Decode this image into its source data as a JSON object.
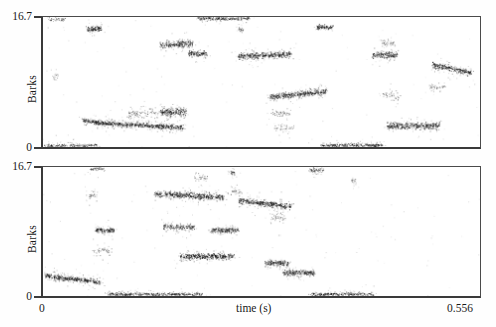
{
  "figure": {
    "title": "",
    "background_color": "#ffffff",
    "ink_color": "#1a1a1a",
    "axis_color": "#3a3a3a"
  },
  "axis_labels": {
    "y_title": "Barks",
    "y_max_top": "16.7",
    "y_min_top": "0",
    "y_max_bottom": "16.7",
    "y_min_bottom": "0",
    "x_title": "time (s)",
    "x_min": "0",
    "x_max": "0.556"
  },
  "chart_data": [
    {
      "type": "scatter",
      "panel": "top",
      "title": "",
      "xlabel": "",
      "ylabel": "Barks",
      "xlim": [
        0,
        0.556
      ],
      "ylim": [
        0,
        16.7
      ],
      "grid": false,
      "legend": "none",
      "marker_color": "#121212",
      "description": "Auditory cochleagram-style point cloud; dark elongated tracks represent formant / harmonic energy streaks.",
      "tracks": [
        {
          "name": "t-low-edge-a",
          "x0": 0.002,
          "x1": 0.068,
          "y0": 0.25,
          "y1": 0.25,
          "thickness": 0.4,
          "density": 0.45,
          "spread": 0.35
        },
        {
          "name": "t-hi-edge-a",
          "x0": 0.006,
          "x1": 0.028,
          "y0": 16.45,
          "y1": 16.45,
          "thickness": 0.4,
          "density": 0.3,
          "spread": 0.4
        },
        {
          "name": "t-blob-1",
          "x0": 0.055,
          "x1": 0.075,
          "y0": 15.2,
          "y1": 15.25,
          "thickness": 0.75,
          "density": 0.95,
          "spread": 0.35
        },
        {
          "name": "t-faint-1",
          "x0": 0.012,
          "x1": 0.018,
          "y0": 9.2,
          "y1": 9.2,
          "thickness": 0.4,
          "density": 0.18,
          "spread": 0.45
        },
        {
          "name": "t-low-1",
          "x0": 0.05,
          "x1": 0.068,
          "y0": 3.45,
          "y1": 3.3,
          "thickness": 0.55,
          "density": 0.8,
          "spread": 0.35
        },
        {
          "name": "t-low-sweep",
          "x0": 0.066,
          "x1": 0.178,
          "y0": 3.15,
          "y1": 2.55,
          "thickness": 0.6,
          "density": 0.92,
          "spread": 0.55
        },
        {
          "name": "t-cloud-1",
          "x0": 0.108,
          "x1": 0.168,
          "y0": 4.2,
          "y1": 4.5,
          "thickness": 1.1,
          "density": 0.35,
          "spread": 1.1
        },
        {
          "name": "t-blob-2",
          "x0": 0.15,
          "x1": 0.182,
          "y0": 4.55,
          "y1": 4.55,
          "thickness": 0.95,
          "density": 0.9,
          "spread": 0.6
        },
        {
          "name": "t-blob-3",
          "x0": 0.148,
          "x1": 0.19,
          "y0": 13.1,
          "y1": 13.35,
          "thickness": 0.8,
          "density": 0.88,
          "spread": 0.5
        },
        {
          "name": "t-blob-4",
          "x0": 0.185,
          "x1": 0.208,
          "y0": 12.05,
          "y1": 12.05,
          "thickness": 0.65,
          "density": 0.85,
          "spread": 0.4
        },
        {
          "name": "t-hi-edge-b",
          "x0": 0.196,
          "x1": 0.262,
          "y0": 16.55,
          "y1": 16.55,
          "thickness": 0.4,
          "density": 0.55,
          "spread": 0.3
        },
        {
          "name": "t-tick-1",
          "x0": 0.248,
          "x1": 0.254,
          "y0": 15.1,
          "y1": 15.1,
          "thickness": 0.55,
          "density": 0.45,
          "spread": 0.5
        },
        {
          "name": "t-arch-1",
          "x0": 0.248,
          "x1": 0.315,
          "y0": 11.7,
          "y1": 11.95,
          "thickness": 0.7,
          "density": 0.9,
          "spread": 0.55
        },
        {
          "name": "t-mid-rise",
          "x0": 0.288,
          "x1": 0.36,
          "y0": 6.45,
          "y1": 7.2,
          "thickness": 0.7,
          "density": 0.92,
          "spread": 0.5
        },
        {
          "name": "t-faint-2",
          "x0": 0.29,
          "x1": 0.315,
          "y0": 4.35,
          "y1": 4.35,
          "thickness": 0.7,
          "density": 0.25,
          "spread": 0.7
        },
        {
          "name": "t-faint-3",
          "x0": 0.292,
          "x1": 0.318,
          "y0": 2.55,
          "y1": 2.55,
          "thickness": 0.6,
          "density": 0.2,
          "spread": 0.7
        },
        {
          "name": "t-blob-5",
          "x0": 0.348,
          "x1": 0.368,
          "y0": 15.45,
          "y1": 15.45,
          "thickness": 0.55,
          "density": 0.85,
          "spread": 0.3
        },
        {
          "name": "t-low-edge-b",
          "x0": 0.352,
          "x1": 0.432,
          "y0": 0.28,
          "y1": 0.28,
          "thickness": 0.4,
          "density": 0.55,
          "spread": 0.35
        },
        {
          "name": "t-blob-6",
          "x0": 0.418,
          "x1": 0.45,
          "y0": 11.85,
          "y1": 11.85,
          "thickness": 0.75,
          "density": 0.88,
          "spread": 0.55
        },
        {
          "name": "t-faint-4",
          "x0": 0.428,
          "x1": 0.448,
          "y0": 13.4,
          "y1": 13.4,
          "thickness": 0.65,
          "density": 0.3,
          "spread": 0.7
        },
        {
          "name": "t-faint-5",
          "x0": 0.432,
          "x1": 0.452,
          "y0": 7.1,
          "y1": 6.3,
          "thickness": 0.7,
          "density": 0.28,
          "spread": 0.85
        },
        {
          "name": "t-low-bar",
          "x0": 0.438,
          "x1": 0.505,
          "y0": 2.75,
          "y1": 2.8,
          "thickness": 0.8,
          "density": 0.92,
          "spread": 0.5
        },
        {
          "name": "t-descend",
          "x0": 0.495,
          "x1": 0.545,
          "y0": 10.6,
          "y1": 9.55,
          "thickness": 0.7,
          "density": 0.88,
          "spread": 0.5
        },
        {
          "name": "t-faint-6",
          "x0": 0.492,
          "x1": 0.512,
          "y0": 7.7,
          "y1": 7.7,
          "thickness": 0.7,
          "density": 0.25,
          "spread": 0.75
        }
      ]
    },
    {
      "type": "scatter",
      "panel": "bottom",
      "title": "",
      "xlabel": "time (s)",
      "ylabel": "Barks",
      "xlim": [
        0,
        0.556
      ],
      "ylim": [
        0,
        16.7
      ],
      "grid": false,
      "legend": "none",
      "marker_color": "#121212",
      "description": "Resynthesised / second-condition cochleagram; tracks are flatter and more segmented.",
      "tracks": [
        {
          "name": "b-low-sweep",
          "x0": 0.002,
          "x1": 0.072,
          "y0": 2.65,
          "y1": 1.85,
          "thickness": 0.6,
          "density": 0.9,
          "spread": 0.55
        },
        {
          "name": "b-hi-edge-a",
          "x0": 0.06,
          "x1": 0.078,
          "y0": 16.5,
          "y1": 16.5,
          "thickness": 0.4,
          "density": 0.4,
          "spread": 0.35
        },
        {
          "name": "b-faint-1",
          "x0": 0.055,
          "x1": 0.068,
          "y0": 13.05,
          "y1": 13.05,
          "thickness": 0.85,
          "density": 0.3,
          "spread": 0.8
        },
        {
          "name": "b-blob-1",
          "x0": 0.066,
          "x1": 0.09,
          "y0": 8.55,
          "y1": 8.55,
          "thickness": 0.65,
          "density": 0.88,
          "spread": 0.4
        },
        {
          "name": "b-faint-2",
          "x0": 0.062,
          "x1": 0.086,
          "y0": 5.9,
          "y1": 5.9,
          "thickness": 0.6,
          "density": 0.25,
          "spread": 0.7
        },
        {
          "name": "b-low-edge-a",
          "x0": 0.082,
          "x1": 0.202,
          "y0": 0.28,
          "y1": 0.28,
          "thickness": 0.4,
          "density": 0.55,
          "spread": 0.35
        },
        {
          "name": "b-hi-bar",
          "x0": 0.142,
          "x1": 0.23,
          "y0": 13.3,
          "y1": 12.8,
          "thickness": 0.7,
          "density": 0.92,
          "spread": 0.55
        },
        {
          "name": "b-blob-2",
          "x0": 0.152,
          "x1": 0.192,
          "y0": 9.0,
          "y1": 8.9,
          "thickness": 0.65,
          "density": 0.7,
          "spread": 0.55
        },
        {
          "name": "b-mid-bar",
          "x0": 0.174,
          "x1": 0.242,
          "y0": 5.15,
          "y1": 5.2,
          "thickness": 0.85,
          "density": 0.92,
          "spread": 0.5
        },
        {
          "name": "b-faint-3",
          "x0": 0.192,
          "x1": 0.21,
          "y0": 15.35,
          "y1": 15.35,
          "thickness": 0.45,
          "density": 0.22,
          "spread": 0.55
        },
        {
          "name": "b-blob-3",
          "x0": 0.212,
          "x1": 0.248,
          "y0": 8.55,
          "y1": 8.55,
          "thickness": 0.6,
          "density": 0.85,
          "spread": 0.4
        },
        {
          "name": "b-tick-2",
          "x0": 0.238,
          "x1": 0.244,
          "y0": 16.05,
          "y1": 16.05,
          "thickness": 0.6,
          "density": 0.6,
          "spread": 0.45
        },
        {
          "name": "b-faint-4",
          "x0": 0.238,
          "x1": 0.252,
          "y0": 13.6,
          "y1": 13.6,
          "thickness": 0.6,
          "density": 0.25,
          "spread": 0.65
        },
        {
          "name": "b-descend-1",
          "x0": 0.248,
          "x1": 0.315,
          "y0": 12.4,
          "y1": 11.65,
          "thickness": 0.7,
          "density": 0.92,
          "spread": 0.55
        },
        {
          "name": "b-faint-5",
          "x0": 0.288,
          "x1": 0.308,
          "y0": 10.3,
          "y1": 10.3,
          "thickness": 0.7,
          "density": 0.28,
          "spread": 0.8
        },
        {
          "name": "b-blob-4",
          "x0": 0.282,
          "x1": 0.312,
          "y0": 4.3,
          "y1": 4.3,
          "thickness": 0.7,
          "density": 0.88,
          "spread": 0.45
        },
        {
          "name": "b-blob-5",
          "x0": 0.305,
          "x1": 0.345,
          "y0": 3.05,
          "y1": 3.05,
          "thickness": 0.7,
          "density": 0.9,
          "spread": 0.45
        },
        {
          "name": "b-hi-edge-b",
          "x0": 0.338,
          "x1": 0.356,
          "y0": 16.35,
          "y1": 16.35,
          "thickness": 0.5,
          "density": 0.5,
          "spread": 0.4
        },
        {
          "name": "b-low-edge-b",
          "x0": 0.34,
          "x1": 0.42,
          "y0": 0.28,
          "y1": 0.28,
          "thickness": 0.4,
          "density": 0.55,
          "spread": 0.35
        },
        {
          "name": "b-faint-6",
          "x0": 0.392,
          "x1": 0.398,
          "y0": 14.9,
          "y1": 14.9,
          "thickness": 0.45,
          "density": 0.3,
          "spread": 0.55
        }
      ]
    }
  ],
  "panels": [
    {
      "name": "top-panel",
      "id": "panel-top"
    },
    {
      "name": "bottom-panel",
      "id": "panel-bottom"
    }
  ]
}
